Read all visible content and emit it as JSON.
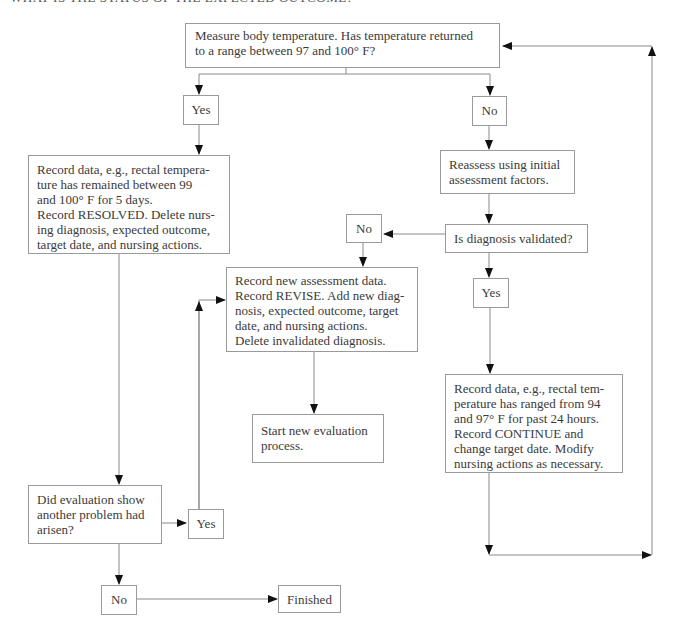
{
  "heading_clipped": "WHAT IS THE STATUS OF THE EXPECTED OUTCOME?",
  "nodes": {
    "measure": {
      "lines": [
        "Measure body temperature. Has temperature returned",
        "to a range between 97 and 100° F?"
      ]
    },
    "yes_top": {
      "label": "Yes"
    },
    "no_top": {
      "label": "No"
    },
    "resolved": {
      "lines": [
        "Record data, e.g., rectal tempera-",
        "ture has remained between 99",
        "and 100° F for 5 days.",
        "Record RESOLVED. Delete nurs-",
        "ing diagnosis, expected outcome,",
        "target date, and nursing actions."
      ]
    },
    "reassess": {
      "lines": [
        "Reassess using initial",
        "assessment factors."
      ]
    },
    "validated": {
      "lines": [
        "Is diagnosis validated?"
      ]
    },
    "no_mid": {
      "label": "No"
    },
    "yes_mid": {
      "label": "Yes"
    },
    "revise": {
      "lines": [
        "Record new assessment data.",
        "Record REVISE. Add new diag-",
        "nosis, expected outcome, target",
        "date, and nursing actions.",
        "Delete invalidated diagnosis."
      ]
    },
    "start_new": {
      "lines": [
        "Start new evaluation",
        "process."
      ]
    },
    "continue": {
      "lines": [
        "Record data, e.g., rectal tem-",
        "perature has ranged from 94",
        "and 97° F for past 24 hours.",
        "Record CONTINUE and",
        "change target date. Modify",
        "nursing actions as necessary."
      ]
    },
    "another_problem": {
      "lines": [
        "Did evaluation show",
        "another problem had",
        "arisen?"
      ]
    },
    "yes_bottom": {
      "label": "Yes"
    },
    "no_bottom": {
      "label": "No"
    },
    "finished": {
      "label": "Finished"
    }
  }
}
